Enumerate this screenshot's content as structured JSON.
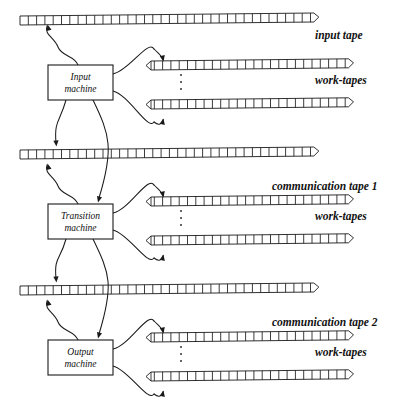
{
  "diagram": {
    "type": "schematic",
    "ink_color": "#1a1a1a",
    "background": "#ffffff"
  },
  "machines": [
    {
      "id": "input-machine",
      "line1": "Input",
      "line2": "machine",
      "x": 48,
      "y": 65,
      "w": 65,
      "h": 35
    },
    {
      "id": "transition-machine",
      "line1": "Transition",
      "line2": "machine",
      "x": 48,
      "y": 204,
      "w": 65,
      "h": 35
    },
    {
      "id": "output-machine",
      "line1": "Output",
      "line2": "machine",
      "x": 48,
      "y": 340,
      "w": 65,
      "h": 35
    }
  ],
  "labels": {
    "input_tape": "input tape",
    "work_tapes_1": "work-tapes",
    "communication_tape_1": "communication tape 1",
    "work_tapes_2": "work-tapes",
    "communication_tape_2": "communication tape 2",
    "work_tapes_3": "work-tapes"
  },
  "label_positions": [
    {
      "key": "input_tape",
      "text": "input tape",
      "x": 315,
      "y": 39,
      "anchor": "start"
    },
    {
      "key": "work_tapes_1",
      "text": "work-tapes",
      "x": 315,
      "y": 84,
      "anchor": "start"
    },
    {
      "key": "communication_tape_1",
      "text": "communication tape 1",
      "x": 272,
      "y": 190,
      "anchor": "start"
    },
    {
      "key": "work_tapes_2",
      "text": "work-tapes",
      "x": 315,
      "y": 220,
      "anchor": "start"
    },
    {
      "key": "communication_tape_2",
      "text": "communication tape 2",
      "x": 272,
      "y": 326,
      "anchor": "start"
    },
    {
      "key": "work_tapes_3",
      "text": "work-tapes",
      "x": 315,
      "y": 356,
      "anchor": "start"
    }
  ],
  "tapes": [
    {
      "id": "input-tape",
      "kind": "long",
      "x": 20,
      "y": 16,
      "cells": 36,
      "cell_w": 8.3,
      "h": 9,
      "slant": -3.0,
      "label": "input tape"
    },
    {
      "id": "work-tape-1a",
      "kind": "short",
      "x": 146,
      "y": 61,
      "cells": 25,
      "cell_w": 8.3,
      "h": 9,
      "slant": -2.2,
      "label": "work-tapes"
    },
    {
      "id": "work-tape-1b",
      "kind": "short",
      "x": 146,
      "y": 100,
      "cells": 25,
      "cell_w": 8.3,
      "h": 9,
      "slant": -2.2,
      "label": "work-tapes"
    },
    {
      "id": "communication-tape-1",
      "kind": "long",
      "x": 20,
      "y": 150,
      "cells": 36,
      "cell_w": 8.3,
      "h": 9,
      "slant": -3.0,
      "label": "communication tape 1"
    },
    {
      "id": "work-tape-2a",
      "kind": "short",
      "x": 146,
      "y": 197,
      "cells": 25,
      "cell_w": 8.3,
      "h": 9,
      "slant": -2.2,
      "label": "work-tapes"
    },
    {
      "id": "work-tape-2b",
      "kind": "short",
      "x": 146,
      "y": 236,
      "cells": 25,
      "cell_w": 8.3,
      "h": 9,
      "slant": -2.2,
      "label": "work-tapes"
    },
    {
      "id": "communication-tape-2",
      "kind": "long",
      "x": 20,
      "y": 286,
      "cells": 36,
      "cell_w": 8.3,
      "h": 9,
      "slant": -3.0,
      "label": "communication tape 2"
    },
    {
      "id": "work-tape-3a",
      "kind": "short",
      "x": 146,
      "y": 333,
      "cells": 25,
      "cell_w": 8.3,
      "h": 9,
      "slant": -2.2,
      "label": "work-tapes"
    },
    {
      "id": "work-tape-3b",
      "kind": "short",
      "x": 146,
      "y": 372,
      "cells": 25,
      "cell_w": 8.3,
      "h": 9,
      "slant": -2.2,
      "label": "work-tapes"
    }
  ],
  "ellipses": [
    {
      "id": "vdots-1",
      "x": 181,
      "y": 82,
      "count": 3
    },
    {
      "id": "vdots-2",
      "x": 181,
      "y": 218,
      "count": 3
    },
    {
      "id": "vdots-3",
      "x": 181,
      "y": 354,
      "count": 3
    }
  ],
  "connections": [
    {
      "id": "input-machine-to-input-tape",
      "from": "input-machine",
      "to": "input-tape",
      "direction": "read"
    },
    {
      "id": "input-machine-to-work-tape-1a",
      "from": "input-machine",
      "to": "work-tape-1a",
      "direction": "write"
    },
    {
      "id": "input-machine-to-work-tape-1b",
      "from": "input-machine",
      "to": "work-tape-1b",
      "direction": "write"
    },
    {
      "id": "input-machine-to-comm-tape-1",
      "from": "input-machine",
      "to": "communication-tape-1",
      "direction": "write"
    },
    {
      "id": "comm-tape-1-to-transition-machine",
      "from": "communication-tape-1",
      "to": "transition-machine",
      "direction": "read"
    },
    {
      "id": "transition-machine-to-comm-tape-1",
      "from": "transition-machine",
      "to": "communication-tape-1",
      "direction": "read"
    },
    {
      "id": "transition-machine-to-work-tape-2a",
      "from": "transition-machine",
      "to": "work-tape-2a",
      "direction": "write"
    },
    {
      "id": "transition-machine-to-work-tape-2b",
      "from": "transition-machine",
      "to": "work-tape-2b",
      "direction": "write"
    },
    {
      "id": "transition-machine-to-comm-tape-2",
      "from": "transition-machine",
      "to": "communication-tape-2",
      "direction": "write"
    },
    {
      "id": "comm-tape-2-to-output-machine",
      "from": "communication-tape-2",
      "to": "output-machine",
      "direction": "read"
    },
    {
      "id": "output-machine-to-work-tape-3a",
      "from": "output-machine",
      "to": "work-tape-3a",
      "direction": "write"
    },
    {
      "id": "output-machine-to-work-tape-3b",
      "from": "output-machine",
      "to": "work-tape-3b",
      "direction": "write"
    }
  ]
}
